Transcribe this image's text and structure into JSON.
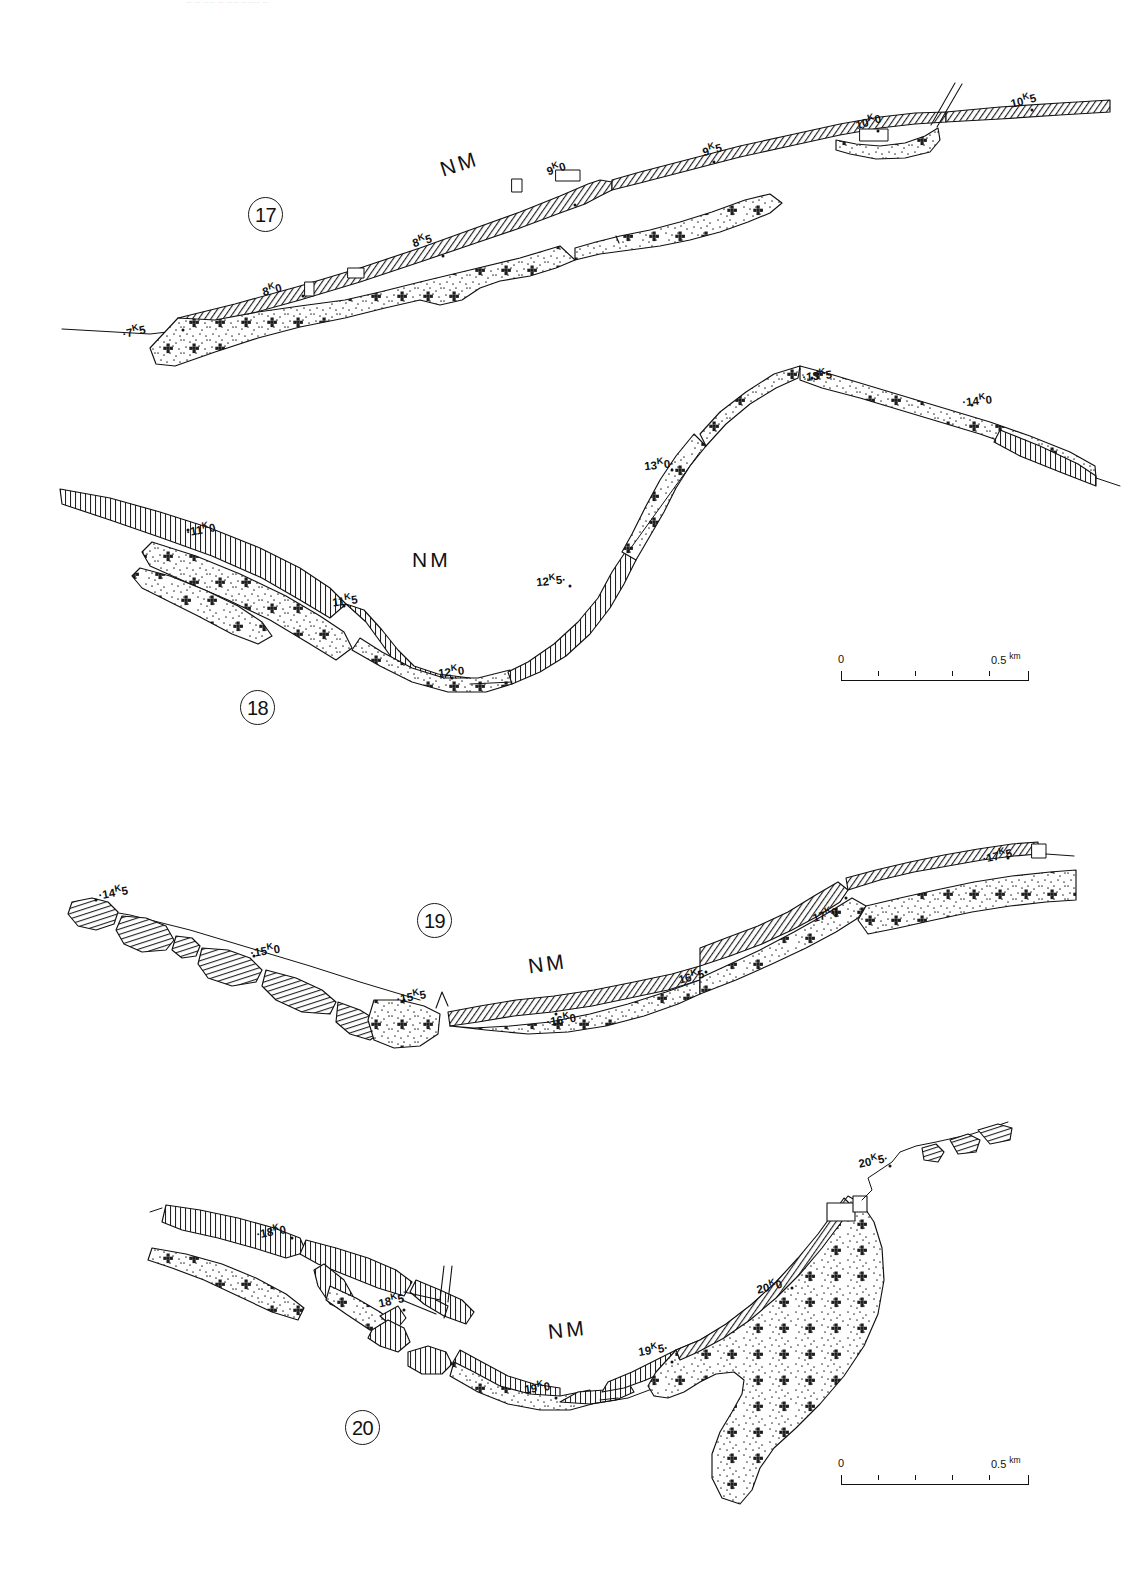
{
  "figure": {
    "kind": "geomorphological-strip-map",
    "truncated_caption_top": "… … …… … ……  ……… …",
    "panels": [
      {
        "number": "17",
        "badge_pos": {
          "x": 248,
          "y": 197
        },
        "area_label": "NM",
        "area_label_pos": {
          "x": 440,
          "y": 152
        },
        "km_labels": [
          {
            "text": "·7",
            "sup": "K",
            "tail": "5",
            "x": 122,
            "y": 323,
            "rot": -12
          },
          {
            "text": "8",
            "sup": "K",
            "tail": "0",
            "x": 262,
            "y": 281,
            "rot": -14
          },
          {
            "text": "8",
            "sup": "K",
            "tail": "5",
            "x": 412,
            "y": 232,
            "rot": -16
          },
          {
            "text": "9",
            "sup": "K",
            "tail": "0",
            "x": 546,
            "y": 160,
            "rot": -18
          },
          {
            "text": "9",
            "sup": "K",
            "tail": "5",
            "x": 702,
            "y": 141,
            "rot": -15
          },
          {
            "text": "10",
            "sup": "K",
            "tail": "0",
            "x": 855,
            "y": 113,
            "rot": -16
          },
          {
            "text": "10",
            "sup": "K",
            "tail": "5",
            "x": 1010,
            "y": 92,
            "rot": -14
          }
        ]
      },
      {
        "number": "18",
        "badge_pos": {
          "x": 240,
          "y": 690
        },
        "area_label": "NM",
        "area_label_pos": {
          "x": 412,
          "y": 548
        },
        "km_labels": [
          {
            "text": "·11",
            "sup": "K",
            "tail": "0",
            "x": 186,
            "y": 521,
            "rot": -10
          },
          {
            "text": "11",
            "sup": "K",
            "tail": "5",
            "x": 332,
            "y": 592,
            "rot": -8
          },
          {
            "text": "12",
            "sup": "K",
            "tail": "0",
            "x": 438,
            "y": 663,
            "rot": -6
          },
          {
            "text": "12",
            "sup": "K",
            "tail": "5·",
            "x": 536,
            "y": 572,
            "rot": -6
          },
          {
            "text": "13",
            "sup": "K",
            "tail": "0·",
            "x": 644,
            "y": 456,
            "rot": -6
          },
          {
            "text": "·13",
            "sup": "K",
            "tail": "5",
            "x": 802,
            "y": 367,
            "rot": -6
          },
          {
            "text": "·14",
            "sup": "K",
            "tail": "0",
            "x": 962,
            "y": 392,
            "rot": -6
          }
        ]
      },
      {
        "number": "19",
        "badge_pos": {
          "x": 417,
          "y": 903
        },
        "area_label": "NM",
        "area_label_pos": {
          "x": 528,
          "y": 952
        },
        "km_labels": [
          {
            "text": "·14",
            "sup": "K",
            "tail": "5",
            "x": 98,
            "y": 884,
            "rot": -10
          },
          {
            "text": "·15",
            "sup": "K",
            "tail": "0",
            "x": 250,
            "y": 942,
            "rot": -9
          },
          {
            "text": "·15",
            "sup": "K",
            "tail": "5",
            "x": 396,
            "y": 988,
            "rot": -10
          },
          {
            "text": "·16",
            "sup": "K",
            "tail": "0",
            "x": 546,
            "y": 1011,
            "rot": -9
          },
          {
            "text": "16",
            "sup": "K",
            "tail": "5",
            "x": 678,
            "y": 968,
            "rot": -14
          },
          {
            "text": "17",
            "sup": "K",
            "tail": "0",
            "x": 812,
            "y": 906,
            "rot": -16
          },
          {
            "text": "·17",
            "sup": "K",
            "tail": "5",
            "x": 982,
            "y": 847,
            "rot": -12
          }
        ]
      },
      {
        "number": "20",
        "badge_pos": {
          "x": 345,
          "y": 1410
        },
        "area_label": "NM",
        "area_label_pos": {
          "x": 548,
          "y": 1318
        },
        "km_labels": [
          {
            "text": "·18",
            "sup": "K",
            "tail": "0",
            "x": 256,
            "y": 1223,
            "rot": -10
          },
          {
            "text": "18",
            "sup": "K",
            "tail": "5",
            "x": 378,
            "y": 1292,
            "rot": -12
          },
          {
            "text": "19",
            "sup": "K",
            "tail": "0",
            "x": 524,
            "y": 1379,
            "rot": -8
          },
          {
            "text": "19",
            "sup": "K",
            "tail": "5·",
            "x": 638,
            "y": 1341,
            "rot": -9
          },
          {
            "text": "20",
            "sup": "K",
            "tail": "0",
            "x": 756,
            "y": 1278,
            "rot": -14
          },
          {
            "text": "20",
            "sup": "K",
            "tail": "5·",
            "x": 858,
            "y": 1152,
            "rot": -12
          }
        ]
      }
    ],
    "scale_bars": [
      {
        "id": "scale-bar-upper",
        "x": 841,
        "y": 657,
        "zero": "0",
        "max": "0.5",
        "unit": "km",
        "divisions": 5
      },
      {
        "id": "scale-bar-lower",
        "x": 841,
        "y": 1461,
        "zero": "0",
        "max": "0.5",
        "unit": "km",
        "divisions": 5
      }
    ],
    "legend_fills": {
      "hatch": "diagonal-line-hatch",
      "stipple": "dotted-stipple-with-cross-clusters"
    },
    "colors": {
      "ink": "#111111",
      "paper": "#ffffff",
      "hatch_grey": "#3a3a3a",
      "stipple_grey": "#4a4a4a"
    }
  }
}
